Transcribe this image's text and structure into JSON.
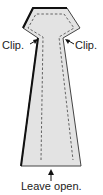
{
  "diagram": {
    "labels": {
      "clip_left": "Clip.",
      "clip_right": "Clip.",
      "bottom": "Leave open."
    },
    "colors": {
      "fill": "#e3e3e3",
      "outline": "#222222",
      "stitch": "#555555"
    }
  }
}
